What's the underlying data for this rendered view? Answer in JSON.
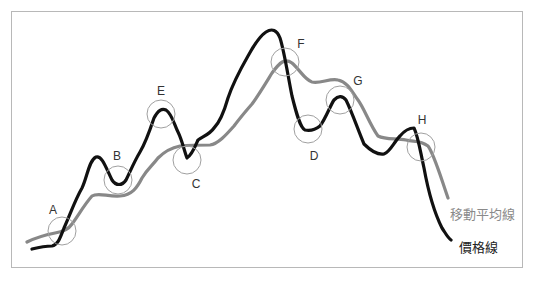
{
  "diagram": {
    "points": [
      {
        "label": "A",
        "cx": 62,
        "cy": 231,
        "lx": 53,
        "ly": 214
      },
      {
        "label": "B",
        "cx": 118,
        "cy": 180,
        "lx": 117,
        "ly": 160
      },
      {
        "label": "E",
        "cx": 161,
        "cy": 114,
        "lx": 161,
        "ly": 95
      },
      {
        "label": "C",
        "cx": 187,
        "cy": 159,
        "lx": 196,
        "ly": 188
      },
      {
        "label": "F",
        "cx": 285,
        "cy": 63,
        "lx": 301,
        "ly": 48
      },
      {
        "label": "G",
        "cx": 340,
        "cy": 100,
        "lx": 358,
        "ly": 85
      },
      {
        "label": "D",
        "cx": 308,
        "cy": 130,
        "lx": 314,
        "ly": 160
      },
      {
        "label": "H",
        "cx": 420,
        "cy": 147,
        "lx": 422,
        "ly": 124
      }
    ],
    "legend": {
      "moving_average": "移動平均線",
      "price_line": "價格線"
    },
    "colors": {
      "price_line": "#111111",
      "moving_average": "#888888",
      "circle": "#a0a0a0",
      "frame": "#b8b8b8"
    }
  }
}
